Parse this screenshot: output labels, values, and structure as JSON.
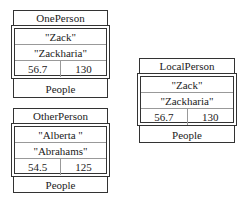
{
  "objects": [
    {
      "name": "OnePerson",
      "fields": [
        "\"Zack\"",
        "\"Zackharia\""
      ],
      "values": [
        "56.7",
        "130"
      ],
      "type": "People"
    },
    {
      "name": "OtherPerson",
      "fields": [
        "\"Alberta \"",
        "\"Abrahams\""
      ],
      "values": [
        "54.5",
        "125"
      ],
      "type": "People"
    },
    {
      "name": "LocalPerson",
      "fields": [
        "\"Zack\"",
        "\"Zackharia\""
      ],
      "values": [
        "56.7",
        "130"
      ],
      "type": "People"
    }
  ]
}
